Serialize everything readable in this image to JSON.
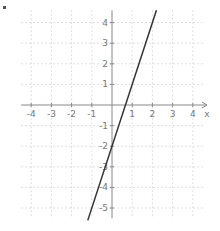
{
  "chart_data": {
    "type": "line",
    "title": "",
    "xlabel": "x",
    "ylabel": "",
    "xlim": [
      -4.5,
      4.5
    ],
    "ylim": [
      -5.5,
      4.6
    ],
    "x_ticks": [
      -4,
      -3,
      -2,
      -1,
      1,
      2,
      3,
      4
    ],
    "y_ticks": [
      4,
      3,
      2,
      1,
      -1,
      -2,
      -3,
      -4,
      -5
    ],
    "grid": true,
    "grid_style": "dashed",
    "series": [
      {
        "name": "y = 3x - 2",
        "equation": "y = 3x - 2",
        "x": [
          -1.2,
          2.2
        ],
        "y": [
          -5.6,
          4.6
        ],
        "color": "#333333"
      }
    ],
    "legend": null
  },
  "colors": {
    "axis": "#888888",
    "grid": "#dddddd",
    "line": "#333333",
    "labels": "#777777"
  },
  "layout": {
    "origin_px": [
      112,
      105
    ],
    "unit_x_px": 20.2,
    "unit_y_px": 20.6
  }
}
